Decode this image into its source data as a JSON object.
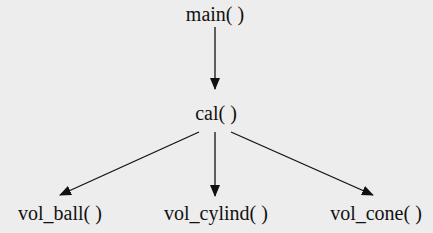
{
  "diagram": {
    "type": "call-tree",
    "nodes": {
      "root": {
        "label": "main( )"
      },
      "mid": {
        "label": "cal( )"
      },
      "leaf1": {
        "label": "vol_ball( )"
      },
      "leaf2": {
        "label": "vol_cylind( )"
      },
      "leaf3": {
        "label": "vol_cone( )"
      }
    },
    "edges": [
      {
        "from": "main( )",
        "to": "cal( )"
      },
      {
        "from": "cal( )",
        "to": "vol_ball( )"
      },
      {
        "from": "cal( )",
        "to": "vol_cylind( )"
      },
      {
        "from": "cal( )",
        "to": "vol_cone( )"
      }
    ],
    "colors": {
      "background": "#ededed",
      "ink": "#111111"
    }
  }
}
